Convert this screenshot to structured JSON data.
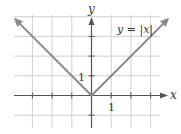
{
  "chart_data": {
    "type": "line",
    "title": "",
    "function_label": "y = |x|",
    "xlabel": "x",
    "ylabel": "y",
    "x_tick_label": "1",
    "y_tick_label": "1",
    "xlim": [
      -4.5,
      3.7
    ],
    "ylim": [
      -1.7,
      4.1
    ],
    "grid": true,
    "series": [
      {
        "name": "y = |x|",
        "x": [
          -3.8,
          0,
          3.8
        ],
        "y": [
          3.8,
          0,
          3.8
        ]
      }
    ]
  },
  "colors": {
    "grid": "#cfcfcf",
    "axis": "#555555",
    "curve": "#8a8a8a"
  }
}
